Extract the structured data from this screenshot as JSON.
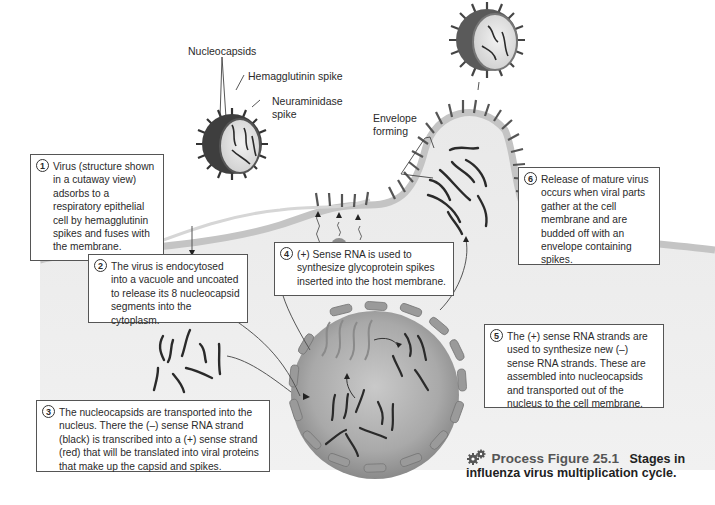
{
  "figure": {
    "number_label": "Process Figure 25.1",
    "title_part1": "Stages in",
    "title_part2": "influenza virus multiplication cycle.",
    "icon": "gears-icon"
  },
  "labels": {
    "nucleocapsids": "Nucleocapsids",
    "hemagglutinin": "Hemagglutinin spike",
    "neuraminidase_line1": "Neuraminidase",
    "neuraminidase_line2": "spike",
    "envelope_line1": "Envelope",
    "envelope_line2": "forming"
  },
  "steps": [
    {
      "n": "1",
      "text": "Virus (structure shown in a cutaway view) adsorbs to a respiratory epithelial cell by hemagglutinin spikes and fuses with the membrane."
    },
    {
      "n": "2",
      "text": "The virus is endocytosed into a vacuole and uncoated to release its 8 nucleocapsid segments into the cytoplasm."
    },
    {
      "n": "3",
      "text": "The nucleocapsids are transported into the nucleus. There the (–) sense RNA strand (black) is transcribed into a (+) sense strand (red) that will be translated into viral proteins that make up the capsid and spikes."
    },
    {
      "n": "4",
      "text": "(+) Sense RNA is used to synthesize glycoprotein spikes inserted into the host membrane."
    },
    {
      "n": "5",
      "text": "The (+) sense RNA strands are used to synthesize new (–) sense RNA strands. These are assembled into nucleocapsids and transported out of the nucleus to the cell membrane."
    },
    {
      "n": "6",
      "text": "Release of mature virus occurs when viral parts gather at the cell membrane and are budded off with an envelope containing spikes."
    }
  ],
  "colors": {
    "cell_fill": "#e4e4e4",
    "cell_edge": "#bdbdbd",
    "nucleus_fill": "#a8a8a8",
    "nucleus_pore": "#8c8c8c",
    "virus_dark": "#3c3c3c",
    "rna_dark": "#2a2a2a",
    "rna_plus": "#8a8a8a",
    "ribosome": "#8f8f8f"
  }
}
